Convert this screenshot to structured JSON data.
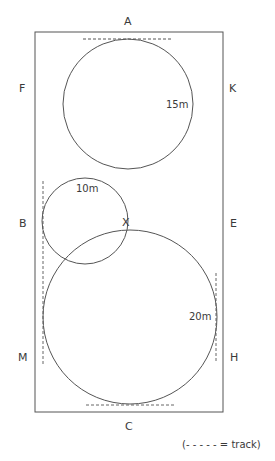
{
  "letters": {
    "A": "A",
    "F": "F",
    "K": "K",
    "B": "B",
    "E": "E",
    "M": "M",
    "H": "H",
    "C": "C"
  },
  "circles": {
    "top": "15m",
    "left": "10m",
    "bottom": "20m"
  },
  "marker": "X",
  "legend": "(- - - - - = track)",
  "colors": {
    "line": "#555555",
    "text": "#3a3a3a"
  }
}
